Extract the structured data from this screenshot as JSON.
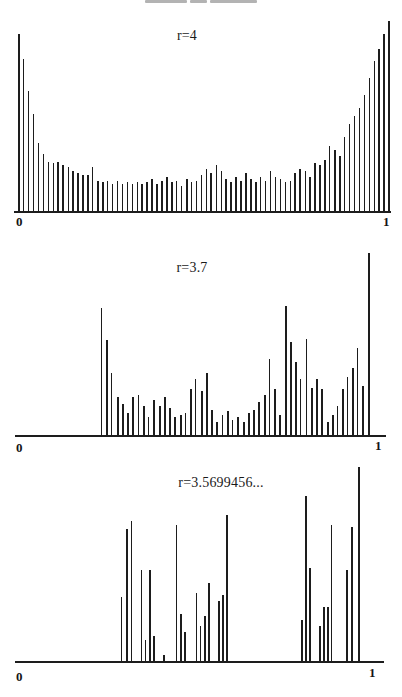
{
  "page": {
    "background": "#ffffff",
    "ink_color": "#1d1d1d",
    "figure_kind": "scanned book figure: invariant-density histograms of the logistic map"
  },
  "top_artifact": {
    "description": "faint gray streak of cropped text at top edge",
    "color": "#9a9a9a",
    "segments": [
      {
        "x": 145,
        "w": 42
      },
      {
        "x": 190,
        "w": 17
      },
      {
        "x": 210,
        "w": 47
      }
    ]
  },
  "chart_data": [
    {
      "type": "bar",
      "title": "r=4",
      "x_ticks": [
        "0",
        "1"
      ],
      "x_range": [
        0,
        1
      ],
      "y_range_px": [
        0,
        190
      ],
      "grid": false,
      "legend": null,
      "bar_style": "thin vertical stems, black ink on white",
      "bars": [
        [
          0.008,
          0.93
        ],
        [
          0.021,
          0.8
        ],
        [
          0.034,
          0.63
        ],
        [
          0.047,
          0.51
        ],
        [
          0.061,
          0.36
        ],
        [
          0.074,
          0.3
        ],
        [
          0.087,
          0.26
        ],
        [
          0.1,
          0.25
        ],
        [
          0.113,
          0.26
        ],
        [
          0.126,
          0.24
        ],
        [
          0.14,
          0.23
        ],
        [
          0.153,
          0.21
        ],
        [
          0.166,
          0.2
        ],
        [
          0.179,
          0.19
        ],
        [
          0.192,
          0.19
        ],
        [
          0.205,
          0.23
        ],
        [
          0.219,
          0.16
        ],
        [
          0.232,
          0.15
        ],
        [
          0.245,
          0.16
        ],
        [
          0.258,
          0.14
        ],
        [
          0.271,
          0.16
        ],
        [
          0.284,
          0.14
        ],
        [
          0.298,
          0.15
        ],
        [
          0.311,
          0.14
        ],
        [
          0.324,
          0.15
        ],
        [
          0.337,
          0.14
        ],
        [
          0.35,
          0.15
        ],
        [
          0.363,
          0.17
        ],
        [
          0.377,
          0.14
        ],
        [
          0.39,
          0.16
        ],
        [
          0.403,
          0.18
        ],
        [
          0.416,
          0.15
        ],
        [
          0.429,
          0.16
        ],
        [
          0.442,
          0.13
        ],
        [
          0.456,
          0.17
        ],
        [
          0.469,
          0.15
        ],
        [
          0.482,
          0.16
        ],
        [
          0.495,
          0.19
        ],
        [
          0.508,
          0.22
        ],
        [
          0.521,
          0.2
        ],
        [
          0.535,
          0.24
        ],
        [
          0.548,
          0.21
        ],
        [
          0.561,
          0.17
        ],
        [
          0.574,
          0.15
        ],
        [
          0.587,
          0.18
        ],
        [
          0.6,
          0.16
        ],
        [
          0.614,
          0.2
        ],
        [
          0.627,
          0.17
        ],
        [
          0.64,
          0.15
        ],
        [
          0.653,
          0.18
        ],
        [
          0.666,
          0.16
        ],
        [
          0.679,
          0.21
        ],
        [
          0.693,
          0.18
        ],
        [
          0.706,
          0.17
        ],
        [
          0.719,
          0.15
        ],
        [
          0.732,
          0.16
        ],
        [
          0.745,
          0.2
        ],
        [
          0.758,
          0.22
        ],
        [
          0.772,
          0.21
        ],
        [
          0.785,
          0.18
        ],
        [
          0.798,
          0.25
        ],
        [
          0.811,
          0.24
        ],
        [
          0.824,
          0.27
        ],
        [
          0.837,
          0.34
        ],
        [
          0.851,
          0.32
        ],
        [
          0.864,
          0.29
        ],
        [
          0.877,
          0.39
        ],
        [
          0.89,
          0.46
        ],
        [
          0.903,
          0.5
        ],
        [
          0.916,
          0.54
        ],
        [
          0.93,
          0.61
        ],
        [
          0.943,
          0.7
        ],
        [
          0.956,
          0.79
        ],
        [
          0.969,
          0.85
        ],
        [
          0.982,
          0.93
        ],
        [
          0.995,
          1.0
        ]
      ]
    },
    {
      "type": "bar",
      "title": "r=3.7",
      "x_ticks": [
        "0",
        "1"
      ],
      "x_range": [
        0,
        1
      ],
      "y_range_px": [
        0,
        182
      ],
      "grid": false,
      "legend": null,
      "bar_style": "thin vertical stems, black ink on white; no bars below x≈0.23",
      "bars": [
        [
          0.232,
          0.7
        ],
        [
          0.246,
          0.52
        ],
        [
          0.259,
          0.34
        ],
        [
          0.276,
          0.21
        ],
        [
          0.289,
          0.17
        ],
        [
          0.303,
          0.12
        ],
        [
          0.316,
          0.21
        ],
        [
          0.332,
          0.22
        ],
        [
          0.346,
          0.16
        ],
        [
          0.359,
          0.1
        ],
        [
          0.373,
          0.19
        ],
        [
          0.389,
          0.16
        ],
        [
          0.403,
          0.21
        ],
        [
          0.416,
          0.15
        ],
        [
          0.43,
          0.1
        ],
        [
          0.446,
          0.11
        ],
        [
          0.459,
          0.12
        ],
        [
          0.473,
          0.25
        ],
        [
          0.486,
          0.31
        ],
        [
          0.503,
          0.24
        ],
        [
          0.516,
          0.34
        ],
        [
          0.53,
          0.14
        ],
        [
          0.543,
          0.07
        ],
        [
          0.559,
          0.11
        ],
        [
          0.573,
          0.13
        ],
        [
          0.586,
          0.08
        ],
        [
          0.6,
          0.1
        ],
        [
          0.616,
          0.07
        ],
        [
          0.63,
          0.12
        ],
        [
          0.643,
          0.14
        ],
        [
          0.657,
          0.18
        ],
        [
          0.673,
          0.22
        ],
        [
          0.686,
          0.42
        ],
        [
          0.7,
          0.25
        ],
        [
          0.714,
          0.11
        ],
        [
          0.73,
          0.71
        ],
        [
          0.743,
          0.51
        ],
        [
          0.757,
          0.4
        ],
        [
          0.77,
          0.31
        ],
        [
          0.786,
          0.53
        ],
        [
          0.8,
          0.26
        ],
        [
          0.814,
          0.31
        ],
        [
          0.827,
          0.25
        ],
        [
          0.843,
          0.07
        ],
        [
          0.857,
          0.11
        ],
        [
          0.87,
          0.16
        ],
        [
          0.884,
          0.25
        ],
        [
          0.897,
          0.32
        ],
        [
          0.911,
          0.37
        ],
        [
          0.924,
          0.48
        ],
        [
          0.938,
          0.27
        ],
        [
          0.954,
          1.0
        ]
      ]
    },
    {
      "type": "bar",
      "title": "r=3.5699456...",
      "x_ticks": [
        "0",
        "1"
      ],
      "x_range": [
        0,
        1
      ],
      "y_range_px": [
        0,
        194
      ],
      "grid": false,
      "legend": null,
      "bar_style": "sparse Cantor-set-like clusters of thin stems",
      "bars": [
        [
          0.287,
          0.33
        ],
        [
          0.301,
          0.68
        ],
        [
          0.314,
          0.72
        ],
        [
          0.341,
          0.47
        ],
        [
          0.352,
          0.11
        ],
        [
          0.363,
          0.47
        ],
        [
          0.374,
          0.13
        ],
        [
          0.401,
          0.03
        ],
        [
          0.436,
          0.7
        ],
        [
          0.447,
          0.24
        ],
        [
          0.458,
          0.15
        ],
        [
          0.49,
          0.35
        ],
        [
          0.501,
          0.18
        ],
        [
          0.512,
          0.23
        ],
        [
          0.523,
          0.4
        ],
        [
          0.55,
          0.31
        ],
        [
          0.561,
          0.34
        ],
        [
          0.572,
          0.75
        ],
        [
          0.775,
          0.21
        ],
        [
          0.786,
          0.85
        ],
        [
          0.797,
          0.48
        ],
        [
          0.824,
          0.18
        ],
        [
          0.835,
          0.28
        ],
        [
          0.846,
          0.28
        ],
        [
          0.856,
          0.7
        ],
        [
          0.897,
          0.47
        ],
        [
          0.911,
          0.69
        ],
        [
          0.93,
          1.0
        ]
      ]
    }
  ]
}
